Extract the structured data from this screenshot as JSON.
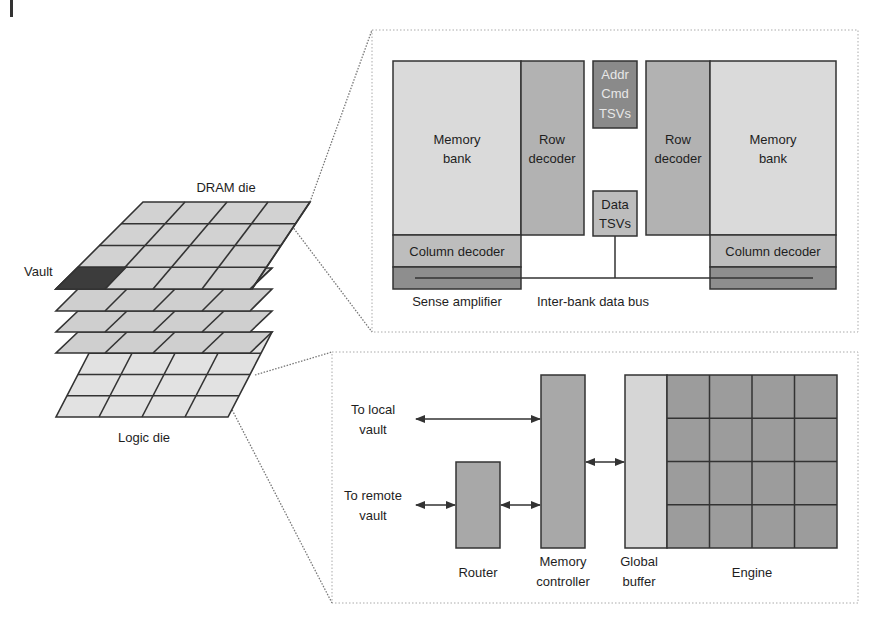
{
  "colors": {
    "light_fill": "#d9d9d9",
    "lighter_fill": "#e4e4e4",
    "mid_fill": "#b4b4b4",
    "dark_fill": "#8c8c8c",
    "darkest_fill": "#3a3a3a",
    "stroke": "#333333",
    "dotted": "#8a8a8a"
  },
  "stack": {
    "dram_label": "DRAM die",
    "logic_label": "Logic die",
    "vault_label": "Vault"
  },
  "dram_die": {
    "left_bank": {
      "memory_bank": "Memory\nbank",
      "memory_bank_l1": "Memory",
      "memory_bank_l2": "bank",
      "row_decoder_l1": "Row",
      "row_decoder_l2": "decoder",
      "column_decoder": "Column decoder"
    },
    "right_bank": {
      "memory_bank_l1": "Memory",
      "memory_bank_l2": "bank",
      "row_decoder_l1": "Row",
      "row_decoder_l2": "decoder",
      "column_decoder": "Column decoder"
    },
    "addr_tsv_l1": "Addr",
    "addr_tsv_l2": "Cmd",
    "addr_tsv_l3": "TSVs",
    "data_tsv_l1": "Data",
    "data_tsv_l2": "TSVs",
    "sense_amplifier": "Sense amplifier",
    "inter_bank_bus": "Inter-bank data bus"
  },
  "logic_die": {
    "to_local_l1": "To local",
    "to_local_l2": "vault",
    "to_remote_l1": "To remote",
    "to_remote_l2": "vault",
    "router": "Router",
    "memory_controller_l1": "Memory",
    "memory_controller_l2": "controller",
    "global_buffer_l1": "Global",
    "global_buffer_l2": "buffer",
    "engine": "Engine",
    "engine_grid": {
      "rows": 4,
      "cols": 4
    }
  }
}
